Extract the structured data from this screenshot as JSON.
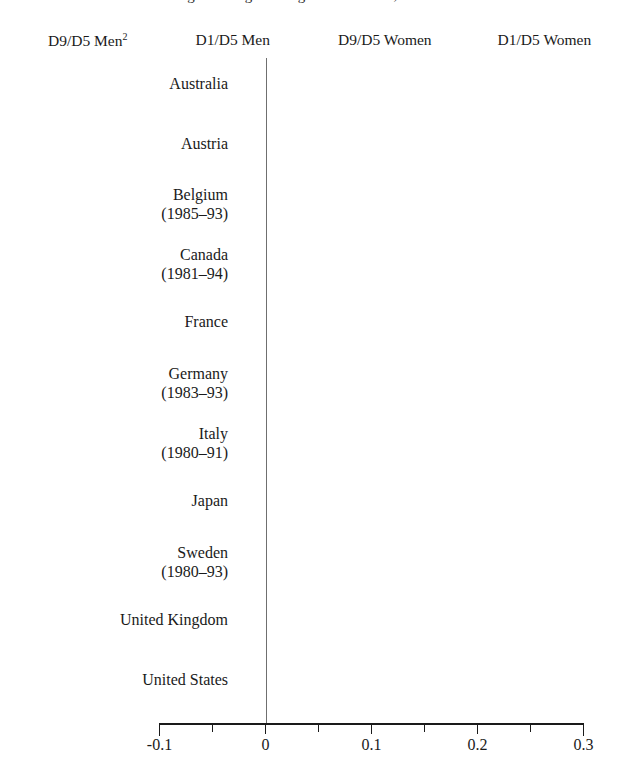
{
  "title": {
    "text": "Changes in Log Earnings Differentials, 1979-1995",
    "visible_fragment": true
  },
  "legend": {
    "position": "top",
    "items": [
      {
        "label": "D9/D5 Men",
        "superscript": "2",
        "color": "#c9c9c9",
        "pattern": "fine-grid"
      },
      {
        "label": "D1/D5 Men",
        "superscript": "",
        "color": "#9e9e9e",
        "pattern": "dense-dot"
      },
      {
        "label": "D9/D5 Women",
        "superscript": "",
        "color": "#dedede",
        "pattern": "light-grid"
      },
      {
        "label": "D1/D5 Women",
        "superscript": "",
        "color": "#757575",
        "pattern": "dark-dot"
      }
    ]
  },
  "axis": {
    "x_ticks": [
      "-0.1",
      "0",
      "0.1",
      "0.2",
      "0.3"
    ],
    "x_minor_ticks": [
      "-0.05",
      "0.05",
      "0.15",
      "0.25"
    ],
    "x_min": -0.1,
    "x_max": 0.3,
    "xlabel": "",
    "ylabel": ""
  },
  "chart_data": {
    "type": "bar",
    "orientation": "horizontal",
    "title": "Changes in Log Earnings Differentials, 1979-1995",
    "xlabel": "",
    "ylabel": "",
    "xlim": [
      -0.1,
      0.3
    ],
    "grid": false,
    "legend_position": "top",
    "categories": [
      "Australia",
      "Austria",
      "Belgium\n(1985–93)",
      "Canada\n(1981–94)",
      "France",
      "Germany\n(1983–93)",
      "Italy\n(1980–91)",
      "Japan",
      "Sweden\n(1980–93)",
      "United Kingdom",
      "United States"
    ],
    "series": [
      {
        "name": "D9/D5 Men",
        "color": "#c9c9c9",
        "values": [
          0.058,
          0.043,
          -0.015,
          0.053,
          0.098,
          0.008,
          0.122,
          0.098,
          0.01,
          0.238,
          0.25
        ]
      },
      {
        "name": "D1/D5 Men",
        "color": "#9e9e9e",
        "values": [
          -0.018,
          -0.018,
          0.008,
          -0.027,
          0.018,
          0.047,
          0.085,
          -0.002,
          -0.03,
          -0.068,
          -0.073
        ]
      },
      {
        "name": "D9/D5 Women",
        "color": "#dedede",
        "values": [
          0.05,
          0.058,
          -0.048,
          0.015,
          0.03,
          0.022,
          0.112,
          0.04,
          0.078,
          0.223,
          0.265
        ]
      },
      {
        "name": "D1/D5 Women",
        "color": "#757575",
        "values": [
          0.022,
          -0.028,
          -0.042,
          -0.03,
          -0.037,
          0.12,
          0.107,
          -0.001,
          -0.032,
          -0.082,
          -0.1
        ]
      }
    ]
  }
}
